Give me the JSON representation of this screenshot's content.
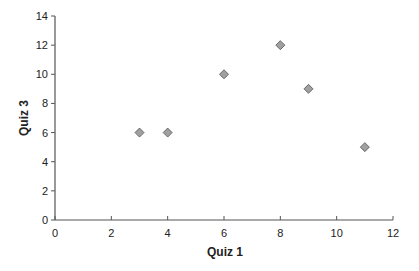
{
  "chart_data": {
    "type": "scatter",
    "title": "",
    "xlabel": "Quiz 1",
    "ylabel": "Quiz 3",
    "xlim": [
      0,
      12
    ],
    "ylim": [
      0,
      14
    ],
    "x_ticks": [
      0,
      2,
      4,
      6,
      8,
      10,
      12
    ],
    "y_ticks": [
      0,
      2,
      4,
      6,
      8,
      10,
      12,
      14
    ],
    "grid": false,
    "legend": null,
    "marker": "diamond",
    "marker_color": "#a0a0a0",
    "marker_edge_color": "#606060",
    "series": [
      {
        "name": "Quiz 1 vs Quiz 3",
        "points": [
          {
            "x": 3,
            "y": 6
          },
          {
            "x": 4,
            "y": 6
          },
          {
            "x": 6,
            "y": 10
          },
          {
            "x": 8,
            "y": 12
          },
          {
            "x": 9,
            "y": 9
          },
          {
            "x": 11,
            "y": 5
          }
        ]
      }
    ]
  }
}
